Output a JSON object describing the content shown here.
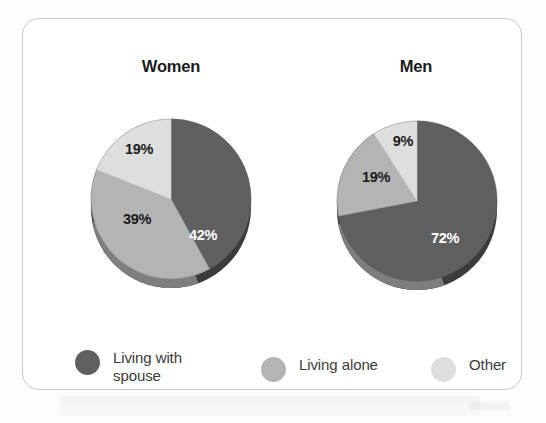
{
  "figure": {
    "background_color": "#fdfdfd",
    "card_border_color": "#c9c9cc"
  },
  "charts": [
    {
      "title": "Women",
      "labels": [
        "42%",
        "39%",
        "19%"
      ]
    },
    {
      "title": "Men",
      "labels": [
        "72%",
        "19%",
        "9%"
      ]
    }
  ],
  "legend": {
    "items": [
      {
        "label": "Living with\nspouse",
        "color": "#5f5f5f"
      },
      {
        "label": "Living alone",
        "color": "#b4b4b4"
      },
      {
        "label": "Other",
        "color": "#dedede"
      }
    ]
  },
  "chart_data": [
    {
      "type": "pie",
      "title": "Women",
      "categories": [
        "Living with spouse",
        "Living alone",
        "Other"
      ],
      "values": [
        42,
        39,
        19
      ],
      "data_labels": [
        "42%",
        "39%",
        "19%"
      ],
      "colors": [
        "#5f5f5f",
        "#b4b4b4",
        "#dedede"
      ],
      "start_angle_deg": 0,
      "direction": "clockwise",
      "legend_position": "bottom",
      "grid": false
    },
    {
      "type": "pie",
      "title": "Men",
      "categories": [
        "Living with spouse",
        "Living alone",
        "Other"
      ],
      "values": [
        72,
        19,
        9
      ],
      "data_labels": [
        "72%",
        "19%",
        "9%"
      ],
      "colors": [
        "#5f5f5f",
        "#b4b4b4",
        "#dedede"
      ],
      "start_angle_deg": 0,
      "direction": "clockwise",
      "legend_position": "bottom",
      "grid": false
    }
  ]
}
